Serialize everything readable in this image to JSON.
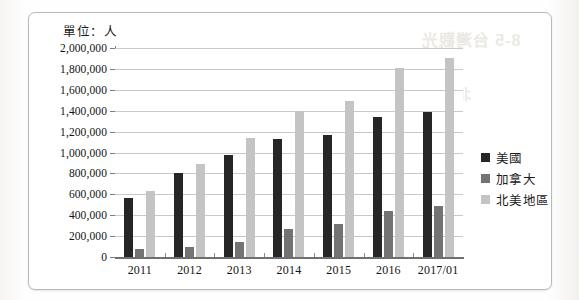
{
  "unit_label": "單位：人",
  "frame": {
    "border_color": "#b9b9b9"
  },
  "bleed_through": {
    "line1": "8-5  台灣觀光",
    "line2": "北美地區市場"
  },
  "legend": {
    "position": "right",
    "items": [
      {
        "label": "美國",
        "color": "#262626"
      },
      {
        "label": "加拿大",
        "color": "#737373"
      },
      {
        "label": "北美地區",
        "color": "#c4c4c4"
      }
    ]
  },
  "chart_data": {
    "type": "bar",
    "title": "",
    "subtitle": "",
    "xlabel": "",
    "ylabel": "單位：人",
    "grid": true,
    "legend_position": "right",
    "ylim": [
      0,
      2000000
    ],
    "ytick_step": 200000,
    "ytick_labels": [
      "2,000,000",
      "1,800,000",
      "1,600,000",
      "1,400,000",
      "1,200,000",
      "1,000,000",
      "800,000",
      "600,000",
      "400,000",
      "200,000",
      "0"
    ],
    "categories": [
      "2011",
      "2012",
      "2013",
      "2014",
      "2015",
      "2016",
      "2017/01"
    ],
    "series": [
      {
        "name": "美國",
        "color": "#262626",
        "values": [
          560000,
          805000,
          980000,
          1130000,
          1165000,
          1340000,
          1390000
        ]
      },
      {
        "name": "加拿大",
        "color": "#737373",
        "values": [
          80000,
          100000,
          145000,
          270000,
          320000,
          440000,
          490000
        ]
      },
      {
        "name": "北美地區",
        "color": "#c4c4c4",
        "values": [
          635000,
          890000,
          1135000,
          1395000,
          1490000,
          1810000,
          1900000
        ]
      }
    ]
  }
}
